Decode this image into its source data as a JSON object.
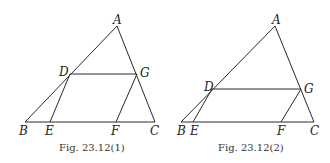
{
  "figures": [
    {
      "caption": "Fig.  23.12(1)",
      "points": {
        "A": {
          "label": "A",
          "x": 117,
          "y": 26
        },
        "B": {
          "label": "B",
          "x": 25,
          "y": 122
        },
        "C": {
          "label": "C",
          "x": 155,
          "y": 122
        },
        "D": {
          "label": "D",
          "x": 70,
          "y": 74
        },
        "G": {
          "label": "G",
          "x": 137,
          "y": 74
        },
        "E": {
          "label": "E",
          "x": 50,
          "y": 122
        },
        "F": {
          "label": "F",
          "x": 116,
          "y": 122
        }
      },
      "segments": [
        "AB",
        "AC",
        "BC",
        "DG",
        "DE",
        "GF"
      ]
    },
    {
      "caption": "Fig.  23.12(2)",
      "points": {
        "A": {
          "label": "A",
          "x": 275,
          "y": 26
        },
        "B": {
          "label": "B",
          "x": 181,
          "y": 122
        },
        "C": {
          "label": "C",
          "x": 314,
          "y": 122
        },
        "D": {
          "label": "D",
          "x": 212,
          "y": 89
        },
        "G": {
          "label": "G",
          "x": 301,
          "y": 89
        },
        "E": {
          "label": "E",
          "x": 193,
          "y": 122
        },
        "F": {
          "label": "F",
          "x": 281,
          "y": 122
        }
      },
      "segments": [
        "AB",
        "AC",
        "BC",
        "DG",
        "DE",
        "GF"
      ]
    }
  ]
}
